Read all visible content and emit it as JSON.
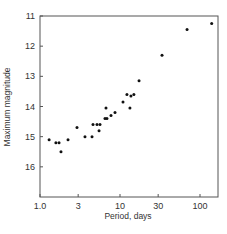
{
  "chart_data": {
    "type": "scatter",
    "title": "",
    "xlabel": "Period, days",
    "ylabel": "Maximum magnitude",
    "xscale": "log",
    "xlim": [
      1.0,
      160
    ],
    "ylim": [
      17,
      11
    ],
    "y_inverted": true,
    "grid": false,
    "legend": null,
    "x_ticks": [
      1.0,
      3,
      10,
      30,
      100
    ],
    "x_tick_labels": [
      "1.0",
      "3",
      "10",
      "30",
      "100"
    ],
    "y_ticks": [
      11,
      12,
      13,
      14,
      15,
      16
    ],
    "y_tick_labels": [
      "11",
      "12",
      "13",
      "14",
      "15",
      "16"
    ],
    "series": [
      {
        "name": "stars",
        "points": [
          {
            "x": 1.3,
            "y": 15.1
          },
          {
            "x": 1.58,
            "y": 15.2
          },
          {
            "x": 1.73,
            "y": 15.2
          },
          {
            "x": 1.83,
            "y": 15.5
          },
          {
            "x": 2.24,
            "y": 15.1
          },
          {
            "x": 2.9,
            "y": 14.7
          },
          {
            "x": 3.65,
            "y": 15.0
          },
          {
            "x": 4.47,
            "y": 15.0
          },
          {
            "x": 4.6,
            "y": 14.6
          },
          {
            "x": 5.16,
            "y": 14.6
          },
          {
            "x": 5.47,
            "y": 14.8
          },
          {
            "x": 5.62,
            "y": 14.6
          },
          {
            "x": 6.49,
            "y": 14.4
          },
          {
            "x": 6.68,
            "y": 14.05
          },
          {
            "x": 6.87,
            "y": 14.4
          },
          {
            "x": 7.72,
            "y": 14.3
          },
          {
            "x": 8.66,
            "y": 14.2
          },
          {
            "x": 10.9,
            "y": 13.85
          },
          {
            "x": 12.2,
            "y": 13.6
          },
          {
            "x": 13.3,
            "y": 14.05
          },
          {
            "x": 13.7,
            "y": 13.65
          },
          {
            "x": 14.9,
            "y": 13.6
          },
          {
            "x": 17.3,
            "y": 13.15
          },
          {
            "x": 33.5,
            "y": 12.3
          },
          {
            "x": 68.9,
            "y": 11.45
          },
          {
            "x": 140,
            "y": 11.25
          }
        ]
      }
    ]
  },
  "style": {
    "frame_color": "#555555",
    "point_color": "#111111",
    "text_color": "#333333"
  }
}
